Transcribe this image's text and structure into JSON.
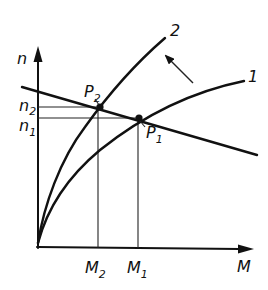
{
  "diagram": {
    "axes": {
      "y_label": "n",
      "x_label": "M"
    },
    "curves": [
      {
        "id": "curve-1",
        "label": "1"
      },
      {
        "id": "curve-2",
        "label": "2"
      }
    ],
    "points": [
      {
        "id": "P1",
        "label": "P",
        "subscript": "1"
      },
      {
        "id": "P2",
        "label": "P",
        "subscript": "2"
      }
    ],
    "y_ticks": [
      {
        "label": "n",
        "subscript": "2"
      },
      {
        "label": "n",
        "subscript": "1"
      }
    ],
    "x_ticks": [
      {
        "label": "M",
        "subscript": "2"
      },
      {
        "label": "M",
        "subscript": "1"
      }
    ],
    "shift_arrow": {
      "direction": "from curve 1 toward curve 2"
    }
  }
}
